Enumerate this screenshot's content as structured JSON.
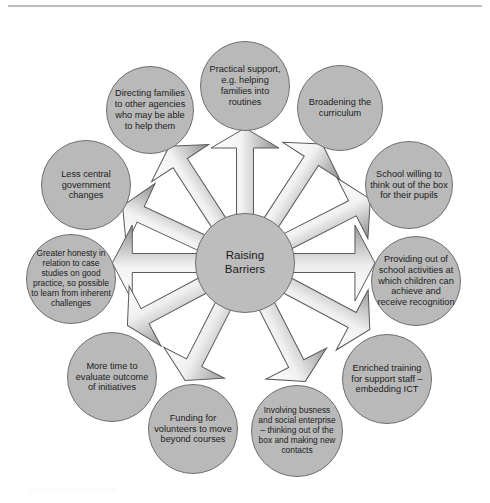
{
  "diagram": {
    "type": "radial-hub-and-spoke",
    "hub": {
      "label": "Raising\nBarriers",
      "line1": "Raising",
      "line2": "Barriers"
    },
    "colors": {
      "node_fill": "#b9b9b9",
      "node_border": "#6f6f6f",
      "arrow_fill_light": "#ffffff",
      "arrow_fill_dark": "#8a8a8a",
      "arrow_border": "#5a5a5a",
      "text": "#1c1c1c",
      "background": "#ffffff"
    },
    "nodes": [
      {
        "id": "practical-support",
        "label": "Practical support, e.g. helping families into routines",
        "angle_deg": 90,
        "cx": 245,
        "cy": 86,
        "r": 45,
        "size": "md"
      },
      {
        "id": "directing-families",
        "label": "Directing families to other agencies who may be able to help them",
        "angle_deg": 123,
        "cx": 150,
        "cy": 110,
        "r": 44,
        "size": "md"
      },
      {
        "id": "broadening-curriculum",
        "label": "Broadening the curriculum",
        "angle_deg": 57,
        "cx": 340,
        "cy": 108,
        "r": 43,
        "size": "md"
      },
      {
        "id": "less-central-government-changes",
        "label": "Less central government changes",
        "angle_deg": 155,
        "cx": 86,
        "cy": 185,
        "r": 45,
        "size": "md"
      },
      {
        "id": "school-willing-think-out-of-box",
        "label": "School willing to think out of the box for their pupils",
        "angle_deg": 27,
        "cx": 409,
        "cy": 185,
        "r": 44,
        "size": "md"
      },
      {
        "id": "greater-honesty-case-studies",
        "label": "Greater honesty in relation to case studies on good practice, so possible to learn from inherent challenges",
        "angle_deg": 180,
        "cx": 71,
        "cy": 279,
        "r": 45,
        "size": "sm"
      },
      {
        "id": "providing-out-of-school-activities",
        "label": "Providing out of school activities at which children can achieve and receive recognition",
        "angle_deg": 0,
        "cx": 416,
        "cy": 281,
        "r": 45,
        "size": "md"
      },
      {
        "id": "more-time-evaluate-outcome",
        "label": "More time to evaluate outcome of initiatives",
        "angle_deg": 208,
        "cx": 112,
        "cy": 377,
        "r": 45,
        "size": "md"
      },
      {
        "id": "enriched-training-support-staff",
        "label": "Enriched training for support staff – embedding ICT",
        "angle_deg": 332,
        "cx": 387,
        "cy": 379,
        "r": 45,
        "size": "md"
      },
      {
        "id": "funding-for-volunteers",
        "label": "Funding for volunteers to move beyond courses",
        "angle_deg": 243,
        "cx": 193,
        "cy": 429,
        "r": 45,
        "size": "md"
      },
      {
        "id": "involving-business-social-enterprise",
        "label": "Involving busness and social enterprise – thinking out of the box and making new contacts",
        "angle_deg": 297,
        "cx": 297,
        "cy": 431,
        "r": 46,
        "size": "sm"
      }
    ],
    "arrows": [
      {
        "id": "arrow-to-practical-support",
        "target": "practical-support",
        "angle_deg": 90,
        "length": 56,
        "width": 17
      },
      {
        "id": "arrow-to-directing-families",
        "target": "directing-families",
        "angle_deg": 123,
        "length": 62,
        "width": 17
      },
      {
        "id": "arrow-to-broadening-curriculum",
        "target": "broadening-curriculum",
        "angle_deg": 57,
        "length": 60,
        "width": 17
      },
      {
        "id": "arrow-to-less-central-government-changes",
        "target": "less-central-government-changes",
        "angle_deg": 155,
        "length": 62,
        "width": 17
      },
      {
        "id": "arrow-to-school-willing-think-out-of-box",
        "target": "school-willing-think-out-of-box",
        "angle_deg": 27,
        "length": 62,
        "width": 17
      },
      {
        "id": "arrow-to-greater-honesty-case-studies",
        "target": "greater-honesty-case-studies",
        "angle_deg": 180,
        "length": 60,
        "width": 19
      },
      {
        "id": "arrow-to-providing-out-of-school-activities",
        "target": "providing-out-of-school-activities",
        "angle_deg": 0,
        "length": 60,
        "width": 19
      },
      {
        "id": "arrow-to-more-time-evaluate-outcome",
        "target": "more-time-evaluate-outcome",
        "angle_deg": 208,
        "length": 60,
        "width": 17
      },
      {
        "id": "arrow-to-enriched-training-support-staff",
        "target": "enriched-training-support-staff",
        "angle_deg": 332,
        "length": 60,
        "width": 17
      },
      {
        "id": "arrow-to-funding-for-volunteers",
        "target": "funding-for-volunteers",
        "angle_deg": 243,
        "length": 62,
        "width": 17
      },
      {
        "id": "arrow-to-involving-business-social-enterprise",
        "target": "involving-business-social-enterprise",
        "angle_deg": 297,
        "length": 62,
        "width": 17
      }
    ],
    "hub_geometry": {
      "cx": 245,
      "cy": 263,
      "r": 50
    }
  }
}
